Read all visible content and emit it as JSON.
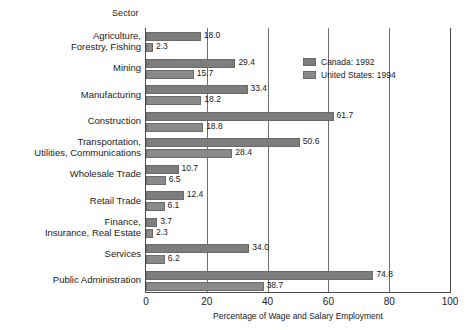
{
  "chart_data": {
    "type": "bar",
    "orientation": "horizontal",
    "grouped": true,
    "title": "",
    "ylabel": "Sector",
    "xlabel": "Percentage of Wage and Salary Employment",
    "xlim": [
      0,
      100
    ],
    "xticks": [
      "0",
      "20",
      "40",
      "60",
      "80",
      "100"
    ],
    "grid": "vertical",
    "legend_position": "top-right",
    "categories": [
      "Agriculture,\nForestry, Fishing",
      "Mining",
      "Manufacturing",
      "Construction",
      "Transportation,\nUtilities, Communications",
      "Wholesale Trade",
      "Retail Trade",
      "Finance,\nInsurance, Real Estate",
      "Services",
      "Public Administration"
    ],
    "series": [
      {
        "name": "Canada: 1992",
        "color": "#7d7d7d",
        "values": [
          18.0,
          29.4,
          33.4,
          61.7,
          50.6,
          10.7,
          12.4,
          3.7,
          34.0,
          74.8
        ],
        "labels": [
          "18.0",
          "29.4",
          "33.4",
          "61.7",
          "50.6",
          "10.7",
          "12.4",
          "3.7",
          "34.0",
          "74.8"
        ]
      },
      {
        "name": "United States: 1994",
        "color": "#8a8a8a",
        "values": [
          2.3,
          15.7,
          18.2,
          18.8,
          28.4,
          6.5,
          6.1,
          2.3,
          6.2,
          38.7
        ],
        "labels": [
          "2.3",
          "15.7",
          "18.2",
          "18.8",
          "28.4",
          "6.5",
          "6.1",
          "2.3",
          "6.2",
          "38.7"
        ]
      }
    ]
  }
}
